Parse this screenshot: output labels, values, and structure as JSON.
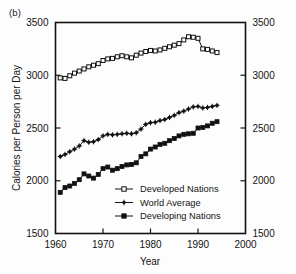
{
  "figure": {
    "panel_label": "(b)",
    "background_color": "#fdfdfd",
    "ink_color": "#111111"
  },
  "chart_data": {
    "type": "line",
    "title": "",
    "xlabel": "Year",
    "ylabel": "Calories per Person per Day",
    "xlim": [
      1960,
      2000
    ],
    "ylim": [
      1500,
      3500
    ],
    "xticks": [
      1960,
      1970,
      1980,
      1990,
      2000
    ],
    "yticks": [
      1500,
      2000,
      2500,
      3000,
      3500
    ],
    "xtick_labels": [
      "1960",
      "1970",
      "1980",
      "1990",
      "2000"
    ],
    "ytick_labels": [
      "1500",
      "2000",
      "2500",
      "3000",
      "3500"
    ],
    "right_axis_labels": [
      "1500",
      "2000",
      "2500",
      "3000",
      "3500"
    ],
    "grid": false,
    "legend_position": "lower right",
    "x": [
      1961,
      1962,
      1963,
      1964,
      1965,
      1966,
      1967,
      1968,
      1969,
      1970,
      1971,
      1972,
      1973,
      1974,
      1975,
      1976,
      1977,
      1978,
      1979,
      1980,
      1981,
      1982,
      1983,
      1984,
      1985,
      1986,
      1987,
      1988,
      1989,
      1990,
      1991,
      1992,
      1993,
      1994
    ],
    "series": [
      {
        "name": "Developed Nations",
        "marker": "open-square",
        "values": [
          2975,
          2970,
          2995,
          3020,
          3040,
          3060,
          3080,
          3095,
          3110,
          3140,
          3155,
          3160,
          3175,
          3185,
          3175,
          3165,
          3190,
          3210,
          3225,
          3235,
          3230,
          3240,
          3255,
          3270,
          3285,
          3300,
          3335,
          3365,
          3360,
          3350,
          3250,
          3245,
          3230,
          3215
        ]
      },
      {
        "name": "World Average",
        "marker": "cross",
        "values": [
          2230,
          2250,
          2275,
          2300,
          2330,
          2380,
          2365,
          2370,
          2390,
          2425,
          2440,
          2435,
          2440,
          2445,
          2450,
          2445,
          2455,
          2490,
          2535,
          2550,
          2555,
          2570,
          2580,
          2600,
          2620,
          2645,
          2660,
          2680,
          2700,
          2705,
          2690,
          2695,
          2705,
          2715
        ]
      },
      {
        "name": "Developing Nations",
        "marker": "filled-square",
        "values": [
          1890,
          1935,
          1950,
          1975,
          2010,
          2065,
          2045,
          2025,
          2060,
          2115,
          2130,
          2100,
          2115,
          2135,
          2150,
          2155,
          2170,
          2230,
          2255,
          2300,
          2320,
          2345,
          2355,
          2380,
          2400,
          2425,
          2440,
          2445,
          2450,
          2500,
          2505,
          2520,
          2545,
          2560
        ]
      }
    ],
    "legend": [
      {
        "label": "Developed Nations",
        "marker": "open-square"
      },
      {
        "label": "World Average",
        "marker": "cross"
      },
      {
        "label": "Developing Nations",
        "marker": "filled-square"
      }
    ]
  }
}
